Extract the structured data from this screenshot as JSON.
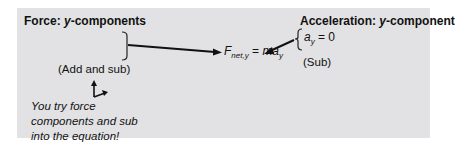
{
  "left_block": {
    "heading_prefix": "Force: ",
    "heading_var": "y",
    "heading_suffix": "-components",
    "note": "(Add and sub)"
  },
  "right_block": {
    "heading_prefix": "Acceleration: ",
    "heading_var": "y",
    "heading_suffix": "-component",
    "value_var": "a",
    "value_sub": "y",
    "value_rest": " = 0",
    "note": "(Sub)"
  },
  "equation": {
    "lhs_var": "F",
    "lhs_sub": "net,y",
    "eq": " = ",
    "rhs_var": "ma",
    "rhs_sub": "y"
  },
  "prompt": {
    "icon": "xy-axes-icon",
    "lines": [
      "You try force",
      "components and sub",
      "into the equation!"
    ]
  },
  "colors": {
    "panel": "#e2e2e4",
    "ink": "#111111"
  }
}
